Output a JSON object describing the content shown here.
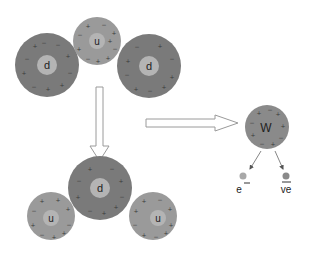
{
  "diagram": {
    "colors": {
      "down_quark": "#7a7a7a",
      "up_quark": "#9a9a9a",
      "core": "#b4b4b4",
      "w_boson": "#8a8a8a",
      "electron": "#a8a8a8",
      "antineutrino": "#8a8a8a",
      "arrow_stroke": "#9a9a9a",
      "background": "#ffffff"
    },
    "neutron": {
      "particles": [
        {
          "label": "d",
          "type": "down",
          "cx": 47,
          "cy": 65,
          "r": 32
        },
        {
          "label": "u",
          "type": "up",
          "cx": 97,
          "cy": 41,
          "r": 24
        },
        {
          "label": "d",
          "type": "down",
          "cx": 149,
          "cy": 66,
          "r": 32
        }
      ]
    },
    "proton": {
      "particles": [
        {
          "label": "u",
          "type": "up",
          "cx": 51,
          "cy": 216,
          "r": 24
        },
        {
          "label": "d",
          "type": "down",
          "cx": 100,
          "cy": 188,
          "r": 32
        },
        {
          "label": "u",
          "type": "up",
          "cx": 153,
          "cy": 216,
          "r": 24
        }
      ]
    },
    "w_boson": {
      "label": "W",
      "cx": 267,
      "cy": 127,
      "r": 22
    },
    "products": [
      {
        "label": "e",
        "superscript": "−",
        "name": "electron",
        "dot_cx": 243,
        "dot_cy": 176
      },
      {
        "label": "ve",
        "overline": true,
        "name": "electron-antineutrino",
        "dot_cx": 286,
        "dot_cy": 176
      }
    ],
    "arrows": [
      {
        "name": "down-arrow",
        "direction": "down"
      },
      {
        "name": "right-arrow",
        "direction": "right"
      },
      {
        "name": "w-to-electron",
        "direction": "down-left"
      },
      {
        "name": "w-to-antineutrino",
        "direction": "down-right"
      }
    ]
  }
}
